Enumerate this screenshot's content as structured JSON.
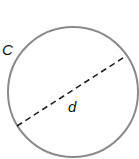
{
  "diagram": {
    "shape": "circle",
    "labels": {
      "circumference": "C",
      "diameter": "d"
    },
    "colors": {
      "circle_stroke": "#888888",
      "diameter_stroke": "#222222",
      "label": "#111111"
    }
  }
}
